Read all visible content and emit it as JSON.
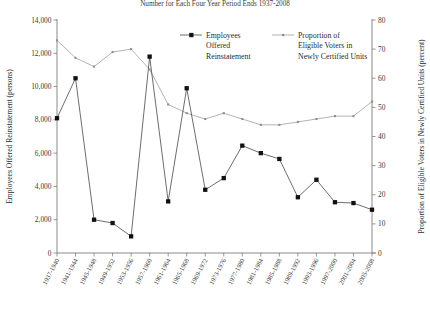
{
  "chart_data": {
    "type": "line",
    "title": "Number for Each Four Year Period Ends 1937-2008",
    "xlabel": "",
    "categories": [
      "1937-1940",
      "1941-1944",
      "1945-1948",
      "1949-1952",
      "1953-1956",
      "1957-1960",
      "1961-1964",
      "1965-1968",
      "1969-1972",
      "1973-1976",
      "1977-1980",
      "1981-1984",
      "1985-1988",
      "1989-1992",
      "1993-1996",
      "1997-2000",
      "2001-2004",
      "2005-2008"
    ],
    "grid": false,
    "legend_position": "top-center",
    "series": [
      {
        "name": "Employees Offered Reinstatement",
        "axis": "left",
        "ylabel": "Employees Offered Reinstatement (persons)",
        "ylim": [
          0,
          14000
        ],
        "yticks": [
          0,
          2000,
          4000,
          6000,
          8000,
          10000,
          12000,
          14000
        ],
        "ytick_labels": [
          "0",
          "2,000",
          "4,000",
          "6,000",
          "8,000",
          "10,000",
          "12,000",
          "14,000"
        ],
        "marker": "square-filled",
        "values": [
          8100,
          10500,
          2000,
          1800,
          1000,
          11800,
          3100,
          9900,
          3800,
          4500,
          6450,
          6000,
          5650,
          3350,
          4400,
          3050,
          3000,
          2600
        ]
      },
      {
        "name": "Proportion of Eligible Voters in Newly Certified Units",
        "axis": "right",
        "ylabel": "Proportion of Eligible Voters in Newly Certified Units (percent)",
        "ylim": [
          0,
          80
        ],
        "yticks": [
          0,
          10,
          20,
          30,
          40,
          50,
          60,
          70,
          80
        ],
        "ytick_labels": [
          "0",
          "10",
          "20",
          "30",
          "40",
          "50",
          "60",
          "70",
          "80"
        ],
        "marker": "square-small",
        "values": [
          73,
          67,
          64,
          69,
          70,
          63,
          51,
          48,
          46,
          48,
          46,
          44,
          44,
          45,
          46,
          47,
          47,
          52
        ]
      }
    ]
  },
  "legend": {
    "entries": [
      {
        "label_lines": [
          "Employees",
          "Offered",
          "Reinstatement"
        ],
        "marker": "square-filled"
      },
      {
        "label_lines": [
          "Proportion of",
          "Eligible Voters in",
          "Newly Certified Units"
        ],
        "marker": "square-small"
      }
    ]
  }
}
